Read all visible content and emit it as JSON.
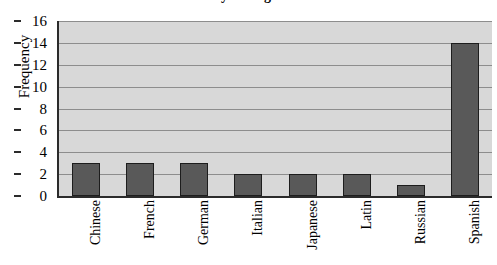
{
  "chart_data": {
    "type": "bar",
    "title": "Studied by College Students",
    "xlabel": "",
    "ylabel": "Frequency",
    "categories": [
      "Chinese",
      "French",
      "German",
      "Italian",
      "Japanese",
      "Latin",
      "Russian",
      "Spanish"
    ],
    "values": [
      3,
      3,
      3,
      2,
      2,
      2,
      1,
      14
    ],
    "ylim": [
      0,
      16
    ],
    "ytick_step": 2,
    "yticks": [
      0,
      2,
      4,
      6,
      8,
      10,
      12,
      14,
      16
    ],
    "ytick_labels": [
      "0",
      "2",
      "4",
      "6",
      "8",
      "10",
      "12",
      "14",
      "16"
    ],
    "grid": true,
    "legend": false,
    "bar_color": "#595959",
    "bar_edge_color": "#1d1d1d",
    "plot_background": "#d8d8d8",
    "gridline_color": "#8d8d8d",
    "axis_color": "#2b2b2b"
  }
}
